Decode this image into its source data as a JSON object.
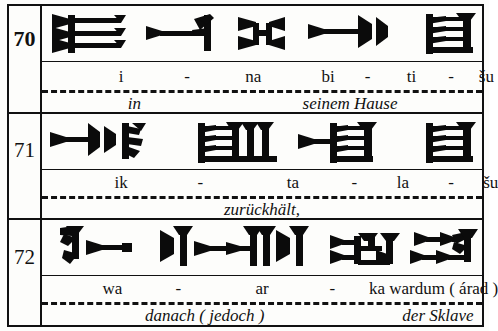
{
  "document": {
    "title": "Cuneiform tablet transliteration table",
    "script": "Old Babylonian cuneiform",
    "translation_language": "German"
  },
  "table": {
    "columns": [
      "line-number",
      "cuneiform",
      "transliteration",
      "translation"
    ],
    "border_color": "#111111",
    "background_color": "#fdfdfb",
    "ink_color": "#0b0b0b"
  },
  "lines": [
    {
      "number": "70",
      "number_bold": true,
      "signs": [
        {
          "name": "sign-i",
          "reading": "i"
        },
        {
          "name": "sign-na",
          "reading": "na"
        },
        {
          "name": "sign-bi",
          "reading": "bi"
        },
        {
          "name": "sign-ti",
          "reading": "ti"
        },
        {
          "name": "sign-shu",
          "reading": "šu"
        }
      ],
      "transliteration": [
        {
          "text": "i",
          "x": 18
        },
        {
          "text": "-",
          "x": 33
        },
        {
          "text": "na",
          "x": 48
        },
        {
          "text": "bi",
          "x": 65
        },
        {
          "text": "-",
          "x": 74
        },
        {
          "text": "ti",
          "x": 84
        },
        {
          "text": "-",
          "x": 93
        },
        {
          "text": "šu",
          "x": 101
        }
      ],
      "translation": [
        {
          "text": "in",
          "x": 21
        },
        {
          "text": "seinem Hause",
          "x": 70
        }
      ]
    },
    {
      "number": "71",
      "number_bold": false,
      "signs": [
        {
          "name": "sign-ik",
          "reading": "ik"
        },
        {
          "name": "sign-ta",
          "reading": "ta"
        },
        {
          "name": "sign-la",
          "reading": "la"
        },
        {
          "name": "sign-shu",
          "reading": "šu"
        }
      ],
      "transliteration": [
        {
          "text": "ik",
          "x": 18
        },
        {
          "text": "-",
          "x": 36
        },
        {
          "text": "ta",
          "x": 57
        },
        {
          "text": "-",
          "x": 71
        },
        {
          "text": "la",
          "x": 82
        },
        {
          "text": "-",
          "x": 93
        },
        {
          "text": "šu",
          "x": 102
        }
      ],
      "translation": [
        {
          "text": "zurückhält,",
          "x": 50
        }
      ]
    },
    {
      "number": "72",
      "number_bold": false,
      "signs": [
        {
          "name": "sign-wa",
          "reading": "wa"
        },
        {
          "name": "sign-ar",
          "reading": "ar"
        },
        {
          "name": "sign-ka",
          "reading": "ka"
        },
        {
          "name": "sign-wardum-arad",
          "reading": "wardum (árad)"
        }
      ],
      "transliteration": [
        {
          "text": "wa",
          "x": 16
        },
        {
          "text": "-",
          "x": 31
        },
        {
          "text": "ar",
          "x": 50
        },
        {
          "text": "-",
          "x": 66
        },
        {
          "text": "ka wardum ( árad )",
          "x": 89
        }
      ],
      "translation": [
        {
          "text": "danach ( jedoch )",
          "x": 37
        },
        {
          "text": "der Sklave",
          "x": 90
        }
      ]
    }
  ]
}
